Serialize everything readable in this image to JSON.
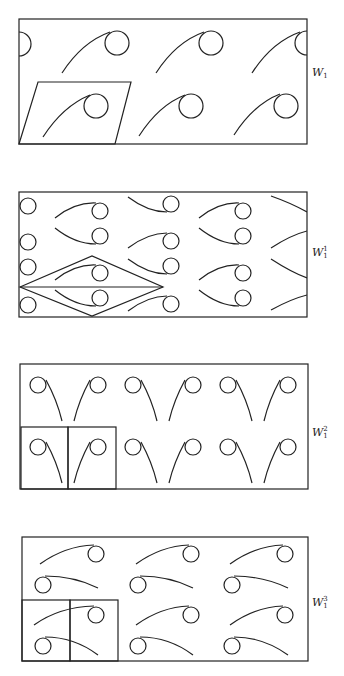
{
  "figure": {
    "stroke_color": "#222222",
    "background": "#ffffff",
    "panels": [
      {
        "id": "W1",
        "label": {
          "base": "W",
          "sub": "1",
          "sup": ""
        },
        "label_pos": [
          312,
          66
        ],
        "box": [
          19,
          19,
          307,
          144
        ],
        "cell_outline": {
          "type": "parallelogram",
          "points": [
            [
              38,
              82
            ],
            [
              131,
              82
            ],
            [
              115,
              144
            ],
            [
              19,
              144
            ]
          ]
        },
        "motifs": [
          {
            "cx": 19,
            "cy": 44,
            "r": 12,
            "arc": null,
            "half": "right"
          },
          {
            "cx": 117,
            "cy": 43,
            "r": 12,
            "arc": "M62,73 Q82,42 110,32"
          },
          {
            "cx": 211,
            "cy": 43,
            "r": 12,
            "arc": "M156,73 Q176,42 204,32"
          },
          {
            "cx": 307,
            "cy": 43,
            "r": 12,
            "arc": "M252,73 Q272,42 300,32",
            "half": "left"
          },
          {
            "cx": 96,
            "cy": 106,
            "r": 12,
            "arc": "M43,137 Q63,106 90,95"
          },
          {
            "cx": 191,
            "cy": 106,
            "r": 12,
            "arc": "M139,136 Q159,105 185,95"
          },
          {
            "cx": 286,
            "cy": 106,
            "r": 12,
            "arc": "M234,135 Q254,104 280,94"
          }
        ]
      },
      {
        "id": "W1_1",
        "label": {
          "base": "W",
          "sub": "1",
          "sup": "1"
        },
        "label_pos": [
          312,
          246
        ],
        "box": [
          19,
          192,
          307,
          317
        ],
        "cell_outline": {
          "type": "rhombus",
          "points": [
            [
              20,
              287
            ],
            [
              92,
              256
            ],
            [
              163,
              287
            ],
            [
              92,
              316
            ]
          ],
          "midline": [
            [
              20,
              287
            ],
            [
              163,
              287
            ]
          ]
        },
        "motifs": [
          {
            "cx": 28,
            "cy": 206,
            "r": 8,
            "arc": null
          },
          {
            "cx": 28,
            "cy": 242,
            "r": 8,
            "arc": null
          },
          {
            "cx": 28,
            "cy": 267,
            "r": 8,
            "arc": null
          },
          {
            "cx": 28,
            "cy": 305,
            "r": 8,
            "arc": null
          },
          {
            "cx": 100,
            "cy": 211,
            "r": 8,
            "arc": "M55,218 Q75,202 96,203"
          },
          {
            "cx": 100,
            "cy": 236,
            "r": 8,
            "arc": "M55,228 Q75,244 96,244"
          },
          {
            "cx": 100,
            "cy": 273,
            "r": 8,
            "arc": "M55,280 Q75,264 96,265"
          },
          {
            "cx": 100,
            "cy": 298,
            "r": 8,
            "arc": "M55,290 Q75,306 96,306"
          },
          {
            "cx": 171,
            "cy": 204,
            "r": 8,
            "arc": "M128,197 Q148,212 167,212"
          },
          {
            "cx": 171,
            "cy": 241,
            "r": 8,
            "arc": "M128,248 Q148,233 167,233"
          },
          {
            "cx": 171,
            "cy": 266,
            "r": 8,
            "arc": "M128,259 Q148,274 167,274"
          },
          {
            "cx": 171,
            "cy": 304,
            "r": 8,
            "arc": "M128,311 Q148,296 167,296"
          },
          {
            "cx": 243,
            "cy": 211,
            "r": 8,
            "arc": "M199,218 Q219,202 239,203"
          },
          {
            "cx": 243,
            "cy": 236,
            "r": 8,
            "arc": "M199,228 Q219,244 239,244"
          },
          {
            "cx": 243,
            "cy": 273,
            "r": 8,
            "arc": "M199,280 Q219,264 239,265"
          },
          {
            "cx": 243,
            "cy": 298,
            "r": 8,
            "arc": "M199,290 Q219,306 239,306"
          },
          {
            "cx": null,
            "cy": null,
            "r": 0,
            "arc": "M271,196 Q291,203 307,212"
          },
          {
            "cx": null,
            "cy": null,
            "r": 0,
            "arc": "M271,248 Q291,235 307,231"
          },
          {
            "cx": null,
            "cy": null,
            "r": 0,
            "arc": "M271,259 Q291,272 307,278"
          },
          {
            "cx": null,
            "cy": null,
            "r": 0,
            "arc": "M271,310 Q291,299 307,295"
          }
        ]
      },
      {
        "id": "W1_2",
        "label": {
          "base": "W",
          "sub": "1",
          "sup": "2"
        },
        "label_pos": [
          312,
          426
        ],
        "box": [
          20,
          364,
          308,
          489
        ],
        "cell_outline": {
          "type": "squares",
          "rects": [
            [
              21,
              427,
              68,
              489
            ],
            [
              68,
              427,
              116,
              489
            ]
          ]
        },
        "motifs": [
          {
            "cx": 38,
            "cy": 385,
            "r": 8,
            "arc": "M46,380 Q57,400 62,421"
          },
          {
            "cx": 98,
            "cy": 385,
            "r": 8,
            "arc": "M90,380 Q79,400 74,421"
          },
          {
            "cx": 133,
            "cy": 385,
            "r": 8,
            "arc": "M141,380 Q152,400 157,421"
          },
          {
            "cx": 193,
            "cy": 385,
            "r": 8,
            "arc": "M185,380 Q174,400 169,421"
          },
          {
            "cx": 228,
            "cy": 385,
            "r": 8,
            "arc": "M236,380 Q247,400 252,421"
          },
          {
            "cx": 288,
            "cy": 385,
            "r": 8,
            "arc": "M280,380 Q269,400 264,421"
          },
          {
            "cx": 38,
            "cy": 447,
            "r": 8,
            "arc": "M46,442 Q57,462 62,483"
          },
          {
            "cx": 98,
            "cy": 447,
            "r": 8,
            "arc": "M90,442 Q79,462 74,483"
          },
          {
            "cx": 133,
            "cy": 447,
            "r": 8,
            "arc": "M141,442 Q152,462 157,483"
          },
          {
            "cx": 193,
            "cy": 447,
            "r": 8,
            "arc": "M185,442 Q174,462 169,483"
          },
          {
            "cx": 228,
            "cy": 447,
            "r": 8,
            "arc": "M236,442 Q247,462 252,483"
          },
          {
            "cx": 288,
            "cy": 447,
            "r": 8,
            "arc": "M280,442 Q269,462 264,483"
          }
        ]
      },
      {
        "id": "W1_3",
        "label": {
          "base": "W",
          "sub": "1",
          "sup": "3"
        },
        "label_pos": [
          312,
          596
        ],
        "box": [
          22,
          537,
          308,
          661
        ],
        "cell_outline": {
          "type": "squares",
          "rects": [
            [
              22,
              600,
              70,
              661
            ],
            [
              70,
              600,
              118,
              661
            ]
          ]
        },
        "motifs": [
          {
            "cx": 96,
            "cy": 554,
            "r": 8,
            "arc": "M40,564 Q65,546 94,545"
          },
          {
            "cx": 43,
            "cy": 585,
            "r": 8,
            "arc": "M45,576 Q74,576 98,588"
          },
          {
            "cx": 191,
            "cy": 554,
            "r": 8,
            "arc": "M136,564 Q161,546 189,545"
          },
          {
            "cx": 138,
            "cy": 585,
            "r": 8,
            "arc": "M140,576 Q169,576 193,588"
          },
          {
            "cx": 285,
            "cy": 554,
            "r": 8,
            "arc": "M230,564 Q255,546 283,545"
          },
          {
            "cx": 232,
            "cy": 585,
            "r": 8,
            "arc": "M234,576 Q263,576 288,588"
          },
          {
            "cx": 96,
            "cy": 615,
            "r": 8,
            "arc": "M34,625 Q59,607 94,606"
          },
          {
            "cx": 43,
            "cy": 646,
            "r": 8,
            "arc": "M45,637 Q74,637 98,655"
          },
          {
            "cx": 191,
            "cy": 615,
            "r": 8,
            "arc": "M136,625 Q161,607 189,606"
          },
          {
            "cx": 138,
            "cy": 646,
            "r": 8,
            "arc": "M140,637 Q169,637 193,655"
          },
          {
            "cx": 285,
            "cy": 615,
            "r": 8,
            "arc": "M230,625 Q255,607 283,606"
          },
          {
            "cx": 232,
            "cy": 646,
            "r": 8,
            "arc": "M234,637 Q263,637 288,655"
          }
        ]
      }
    ]
  }
}
